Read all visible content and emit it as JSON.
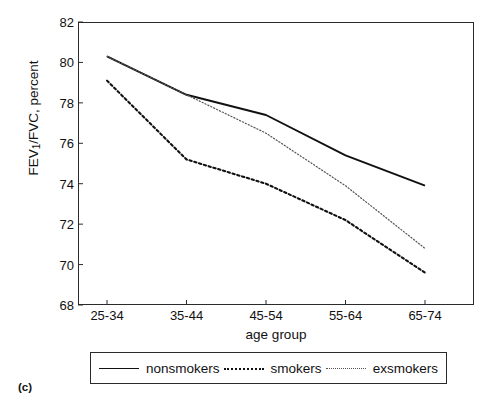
{
  "panel_label": "(c)",
  "chart_data": {
    "type": "line",
    "title": "",
    "xlabel": "age group",
    "ylabel": "FEV1/FVC, percent",
    "ylabel_parts": {
      "pre": "FEV",
      "sub": "1",
      "post": "/FVC, percent"
    },
    "categories": [
      "25-34",
      "35-44",
      "45-54",
      "55-64",
      "65-74"
    ],
    "yticks": [
      68,
      70,
      72,
      74,
      76,
      78,
      80,
      82
    ],
    "ytick_labels": [
      "68",
      "70",
      "72",
      "74",
      "76",
      "78",
      "80",
      "82"
    ],
    "ylim": [
      68,
      82
    ],
    "grid": false,
    "legend_position": "below-plot",
    "series": [
      {
        "name": "nonsmokers",
        "style": "solid",
        "color": "#111111",
        "values": [
          80.3,
          78.4,
          77.4,
          75.4,
          73.9
        ]
      },
      {
        "name": "smokers",
        "style": "dotted-thick",
        "color": "#111111",
        "values": [
          79.1,
          75.2,
          74.0,
          72.2,
          69.6
        ]
      },
      {
        "name": "exsmokers",
        "style": "dotted-fine",
        "color": "#555555",
        "values": [
          80.3,
          78.4,
          76.5,
          73.9,
          70.8
        ]
      }
    ]
  },
  "legend": {
    "entries": [
      {
        "label": "nonsmokers"
      },
      {
        "label": "smokers"
      },
      {
        "label": "exsmokers"
      }
    ]
  }
}
